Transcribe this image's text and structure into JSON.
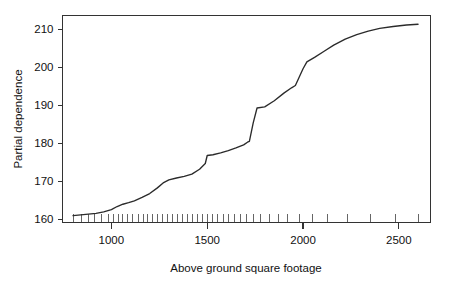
{
  "chart_data": {
    "type": "line",
    "title": "",
    "xlabel": "Above ground square footage",
    "ylabel": "Partial dependence",
    "xlim": [
      745,
      2665
    ],
    "ylim": [
      159.2,
      213.6
    ],
    "grid": false,
    "legend": null,
    "xticks": [
      1000,
      1500,
      2000,
      2500
    ],
    "xtick_labels": [
      "1000",
      "1500",
      "2000",
      "2500"
    ],
    "yticks": [
      160,
      170,
      180,
      190,
      200,
      210
    ],
    "ytick_labels": [
      "160",
      "170",
      "180",
      "190",
      "200",
      "210"
    ],
    "series": [
      {
        "name": "Partial dependence",
        "color": "#2b2b2b",
        "x": [
          800,
          840,
          880,
          920,
          960,
          1000,
          1030,
          1060,
          1090,
          1120,
          1160,
          1200,
          1240,
          1270,
          1300,
          1340,
          1380,
          1420,
          1460,
          1490,
          1500,
          1530,
          1570,
          1610,
          1650,
          1690,
          1710,
          1720,
          1740,
          1760,
          1800,
          1850,
          1900,
          1940,
          1960,
          2000,
          2020,
          2060,
          2110,
          2160,
          2220,
          2280,
          2340,
          2400,
          2470,
          2540,
          2600
        ],
        "y": [
          161.0,
          161.2,
          161.4,
          161.6,
          162.0,
          162.6,
          163.4,
          164.0,
          164.4,
          164.9,
          165.8,
          166.8,
          168.3,
          169.6,
          170.4,
          170.9,
          171.3,
          171.9,
          173.2,
          174.7,
          176.8,
          177.0,
          177.5,
          178.1,
          178.8,
          179.6,
          180.3,
          180.5,
          185.4,
          189.3,
          189.6,
          191.2,
          193.2,
          194.6,
          195.2,
          199.6,
          201.4,
          202.6,
          204.2,
          205.8,
          207.4,
          208.6,
          209.5,
          210.2,
          210.7,
          211.1,
          211.3
        ]
      }
    ],
    "rug_marks": [
      800,
      845,
      880,
      912,
      950,
      986,
      1010,
      1035,
      1060,
      1085,
      1110,
      1140,
      1165,
      1190,
      1215,
      1240,
      1265,
      1292,
      1318,
      1344,
      1370,
      1396,
      1422,
      1448,
      1474,
      1500,
      1528,
      1556,
      1584,
      1612,
      1640,
      1672,
      1704,
      1740,
      1780,
      1824,
      1870,
      1920,
      1980,
      2050,
      2130,
      2230,
      2350,
      2480,
      2600
    ]
  },
  "axis": {
    "x_title": "Above ground square footage",
    "y_title": "Partial dependence"
  }
}
